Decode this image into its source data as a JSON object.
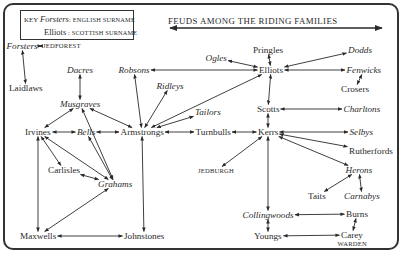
{
  "title": "FEUDS AMONG THE RIDING FAMILIES",
  "key": {
    "label": "KEY",
    "english_example": "Forsters",
    "english_label": ": ENGLISH SURNAME",
    "scottish_example": "Elliots",
    "scottish_label": ": SCOTTISH SURNAME"
  },
  "nodes": [
    {
      "id": "forsters",
      "label": "Forsters",
      "nationality": "english"
    },
    {
      "id": "jedforest",
      "label": "JEDFOREST",
      "nationality": "place"
    },
    {
      "id": "laidlaws",
      "label": "Laidlaws",
      "nationality": "scottish"
    },
    {
      "id": "dacres",
      "label": "Dacres",
      "nationality": "english"
    },
    {
      "id": "musgraves",
      "label": "Musgraves",
      "nationality": "english"
    },
    {
      "id": "robsons",
      "label": "Robsons",
      "nationality": "english"
    },
    {
      "id": "ridleys",
      "label": "Ridleys",
      "nationality": "english"
    },
    {
      "id": "ogles",
      "label": "Ogles",
      "nationality": "english"
    },
    {
      "id": "pringles",
      "label": "Pringles",
      "nationality": "scottish"
    },
    {
      "id": "elliots",
      "label": "Elliots",
      "nationality": "scottish"
    },
    {
      "id": "dodds",
      "label": "Dodds",
      "nationality": "english"
    },
    {
      "id": "fenwicks",
      "label": "Fenwicks",
      "nationality": "english"
    },
    {
      "id": "crosers",
      "label": "Crosers",
      "nationality": "scottish"
    },
    {
      "id": "tailors",
      "label": "Tailors",
      "nationality": "english"
    },
    {
      "id": "scotts",
      "label": "Scotts",
      "nationality": "scottish"
    },
    {
      "id": "charltons",
      "label": "Charltons",
      "nationality": "english"
    },
    {
      "id": "irvines",
      "label": "Irvines",
      "nationality": "scottish"
    },
    {
      "id": "bells",
      "label": "Bells",
      "nationality": "english"
    },
    {
      "id": "armstrongs",
      "label": "Armstrongs",
      "nationality": "scottish"
    },
    {
      "id": "turnbulls",
      "label": "Turnbulls",
      "nationality": "scottish"
    },
    {
      "id": "kerrs",
      "label": "Kerrs",
      "nationality": "scottish"
    },
    {
      "id": "selbys",
      "label": "Selbys",
      "nationality": "english"
    },
    {
      "id": "rutherfords",
      "label": "Rutherfords",
      "nationality": "scottish"
    },
    {
      "id": "carlisles",
      "label": "Carlisles",
      "nationality": "scottish"
    },
    {
      "id": "grahams",
      "label": "Grahams",
      "nationality": "english"
    },
    {
      "id": "jedburgh",
      "label": "JEDBURGH",
      "nationality": "place"
    },
    {
      "id": "herons",
      "label": "Herons",
      "nationality": "english"
    },
    {
      "id": "taits",
      "label": "Taits",
      "nationality": "scottish"
    },
    {
      "id": "carnabys",
      "label": "Carnabys",
      "nationality": "english"
    },
    {
      "id": "collingwoods",
      "label": "Collingwoods",
      "nationality": "english"
    },
    {
      "id": "burns",
      "label": "Burns",
      "nationality": "scottish"
    },
    {
      "id": "maxwells",
      "label": "Maxwells",
      "nationality": "scottish"
    },
    {
      "id": "johnstones",
      "label": "Johnstones",
      "nationality": "scottish"
    },
    {
      "id": "youngs",
      "label": "Youngs",
      "nationality": "scottish"
    },
    {
      "id": "carey",
      "label": "Carey",
      "nationality": "scottish"
    },
    {
      "id": "warden",
      "label": "WARDEN",
      "nationality": "place"
    }
  ],
  "edges": [
    [
      "forsters",
      "jedforest"
    ],
    [
      "forsters",
      "laidlaws"
    ],
    [
      "dacres",
      "musgraves"
    ],
    [
      "musgraves",
      "irvines"
    ],
    [
      "musgraves",
      "armstrongs"
    ],
    [
      "musgraves",
      "grahams"
    ],
    [
      "robsons",
      "elliots"
    ],
    [
      "robsons",
      "armstrongs"
    ],
    [
      "ridleys",
      "armstrongs"
    ],
    [
      "elliots",
      "armstrongs"
    ],
    [
      "tailors",
      "armstrongs"
    ],
    [
      "ogles",
      "elliots"
    ],
    [
      "pringles",
      "elliots"
    ],
    [
      "elliots",
      "dodds"
    ],
    [
      "elliots",
      "fenwicks"
    ],
    [
      "fenwicks",
      "crosers"
    ],
    [
      "elliots",
      "scotts"
    ],
    [
      "scotts",
      "charltons"
    ],
    [
      "scotts",
      "kerrs"
    ],
    [
      "irvines",
      "bells"
    ],
    [
      "bells",
      "armstrongs"
    ],
    [
      "armstrongs",
      "turnbulls"
    ],
    [
      "turnbulls",
      "kerrs"
    ],
    [
      "irvines",
      "carlisles"
    ],
    [
      "irvines",
      "grahams"
    ],
    [
      "irvines",
      "maxwells"
    ],
    [
      "bells",
      "grahams"
    ],
    [
      "carlisles",
      "grahams"
    ],
    [
      "grahams",
      "maxwells"
    ],
    [
      "armstrongs",
      "johnstones"
    ],
    [
      "maxwells",
      "johnstones"
    ],
    [
      "kerrs",
      "selbys"
    ],
    [
      "kerrs",
      "rutherfords"
    ],
    [
      "kerrs",
      "herons"
    ],
    [
      "kerrs",
      "jedburgh"
    ],
    [
      "kerrs",
      "collingwoods"
    ],
    [
      "herons",
      "taits"
    ],
    [
      "herons",
      "carnabys"
    ],
    [
      "collingwoods",
      "burns"
    ],
    [
      "collingwoods",
      "youngs"
    ],
    [
      "burns",
      "carey"
    ],
    [
      "youngs",
      "carey"
    ]
  ]
}
